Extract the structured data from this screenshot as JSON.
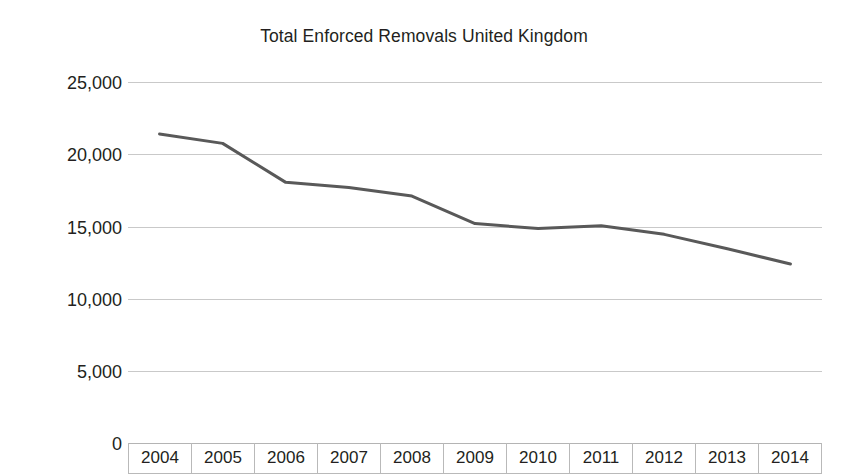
{
  "chart_data": {
    "type": "line",
    "title": "Total Enforced Removals United Kingdom",
    "xlabel": "",
    "ylabel": "",
    "categories": [
      "2004",
      "2005",
      "2006",
      "2007",
      "2008",
      "2009",
      "2010",
      "2011",
      "2012",
      "2013",
      "2014"
    ],
    "values": [
      21400,
      20750,
      18050,
      17700,
      17100,
      15200,
      14850,
      15050,
      14450,
      13450,
      12400
    ],
    "series": [
      {
        "name": "Total Enforced Removals",
        "values": [
          21400,
          20750,
          18050,
          17700,
          17100,
          15200,
          14850,
          15050,
          14450,
          13450,
          12400
        ]
      }
    ],
    "ylim": [
      0,
      25000
    ],
    "y_ticks": [
      0,
      5000,
      10000,
      15000,
      20000,
      25000
    ],
    "y_tick_labels": [
      "0",
      "5,000",
      "10,000",
      "15,000",
      "20,000",
      "25,000"
    ],
    "grid": true,
    "legend": false,
    "legend_position": "none",
    "line_color": "#595959",
    "grid_color": "#c9c9c9",
    "text_color": "#231f20",
    "background_color": "#ffffff"
  }
}
